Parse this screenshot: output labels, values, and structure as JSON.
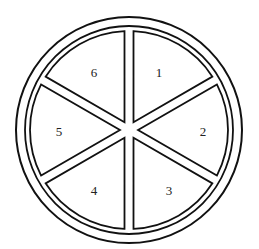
{
  "diagram": {
    "sectors": [
      {
        "label": "1"
      },
      {
        "label": "2"
      },
      {
        "label": "3"
      },
      {
        "label": "4"
      },
      {
        "label": "5"
      },
      {
        "label": "6"
      }
    ],
    "colors": {
      "stroke": "#111111",
      "fill": "#ffffff"
    }
  }
}
